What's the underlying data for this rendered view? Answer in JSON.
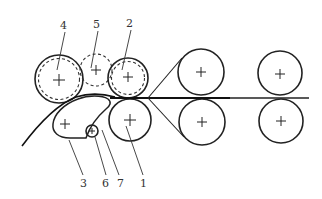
{
  "diagram": {
    "type": "roll arrangement schematic",
    "labels": [
      {
        "id": "1",
        "text": "1",
        "x": 143,
        "y": 187
      },
      {
        "id": "2",
        "text": "2",
        "x": 130,
        "y": 27
      },
      {
        "id": "3",
        "text": "3",
        "x": 83,
        "y": 187
      },
      {
        "id": "4",
        "text": "4",
        "x": 64,
        "y": 29
      },
      {
        "id": "5",
        "text": "5",
        "x": 97,
        "y": 28
      },
      {
        "id": "6",
        "text": "6",
        "x": 105,
        "y": 187
      },
      {
        "id": "7",
        "text": "7",
        "x": 120,
        "y": 187
      }
    ],
    "rolls": [
      {
        "id": "roll-4",
        "cx": 59,
        "cy": 79,
        "r": 24,
        "inner_dashed_r": 20.5
      },
      {
        "id": "roll-5",
        "cx": 96,
        "cy": 70,
        "r": 16,
        "dashed": true
      },
      {
        "id": "roll-2",
        "cx": 128,
        "cy": 78,
        "r": 20,
        "inner_dashed_r": 16.5
      },
      {
        "id": "roll-1",
        "cx": 130,
        "cy": 120,
        "r": 21
      },
      {
        "id": "roll-6",
        "cx": 92,
        "cy": 131,
        "r": 6
      },
      {
        "id": "right-top-1",
        "cx": 201,
        "cy": 72,
        "r": 23
      },
      {
        "id": "right-bottom-1",
        "cx": 202,
        "cy": 122,
        "r": 23
      },
      {
        "id": "right-top-2",
        "cx": 280,
        "cy": 73,
        "r": 22
      },
      {
        "id": "right-bottom-2",
        "cx": 281,
        "cy": 121,
        "r": 22
      }
    ],
    "roll3_center": {
      "cx": 65,
      "cy": 124
    }
  }
}
